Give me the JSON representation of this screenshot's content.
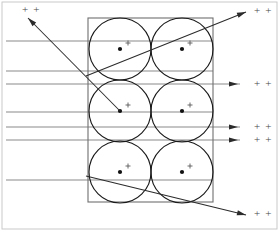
{
  "figure": {
    "width": 279,
    "height": 232,
    "background_color": "#ffffff"
  },
  "colors": {
    "frame": "#c9c9c9",
    "box": "#6f6f6f",
    "circle": "#1a1a1a",
    "ray": "#8a8a8a",
    "diagonal_ray": "#2b2b2b",
    "dot": "#111111",
    "plus": "#5a5a5a",
    "label_text": "#4a4a4a"
  },
  "frame": {
    "name": "outer-frame",
    "x": 2,
    "y": 2,
    "width": 275,
    "height": 227
  },
  "box": {
    "name": "scatterer-box",
    "x": 88,
    "y": 18,
    "width": 125,
    "height": 184
  },
  "circles": [
    {
      "id": "circle-r1c1",
      "cx": 120,
      "cy": 49,
      "r": 31,
      "dot_r": 2.1,
      "plus": {
        "x": 128,
        "y": 43,
        "size": 5
      }
    },
    {
      "id": "circle-r1c2",
      "cx": 182,
      "cy": 49,
      "r": 31,
      "dot_r": 2.1,
      "plus": {
        "x": 190,
        "y": 43,
        "size": 5
      }
    },
    {
      "id": "circle-r2c1",
      "cx": 120,
      "cy": 111,
      "r": 31,
      "dot_r": 2.1,
      "plus": {
        "x": 128,
        "y": 105,
        "size": 5
      }
    },
    {
      "id": "circle-r2c2",
      "cx": 182,
      "cy": 111,
      "r": 31,
      "dot_r": 2.1,
      "plus": {
        "x": 190,
        "y": 105,
        "size": 5
      }
    },
    {
      "id": "circle-r3c1",
      "cx": 120,
      "cy": 172,
      "r": 31,
      "dot_r": 2.1,
      "plus": {
        "x": 128,
        "y": 166,
        "size": 5
      }
    },
    {
      "id": "circle-r3c2",
      "cx": 182,
      "cy": 172,
      "r": 31,
      "dot_r": 2.1,
      "plus": {
        "x": 190,
        "y": 166,
        "size": 5
      }
    }
  ],
  "incoming_rays": [
    {
      "id": "ray-in-1",
      "x1": 6,
      "y1": 41,
      "x2": 213,
      "y2": 41
    },
    {
      "id": "ray-in-2",
      "x1": 6,
      "y1": 71,
      "x2": 213,
      "y2": 71
    },
    {
      "id": "ray-in-3",
      "x1": 6,
      "y1": 84,
      "x2": 240,
      "y2": 84
    },
    {
      "id": "ray-in-4",
      "x1": 6,
      "y1": 112,
      "x2": 213,
      "y2": 112
    },
    {
      "id": "ray-in-5",
      "x1": 6,
      "y1": 127,
      "x2": 240,
      "y2": 127
    },
    {
      "id": "ray-in-6",
      "x1": 6,
      "y1": 140,
      "x2": 240,
      "y2": 140
    },
    {
      "id": "ray-in-7",
      "x1": 6,
      "y1": 180,
      "x2": 213,
      "y2": 180
    }
  ],
  "diagonal_rays": [
    {
      "id": "ray-scattered-up",
      "description": "ray scattered up-left from middle-left circle center",
      "x1": 120,
      "y1": 111,
      "x2": 28,
      "y2": 18
    },
    {
      "id": "ray-scattered-through-top",
      "description": "ray rising through box to upper right exit",
      "x1": 86,
      "y1": 76,
      "x2": 246,
      "y2": 12
    },
    {
      "id": "ray-scattered-down",
      "description": "ray descending from lower-left toward lower right exit",
      "x1": 86,
      "y1": 176,
      "x2": 246,
      "y2": 215
    }
  ],
  "exit_arrows": [
    {
      "id": "arrow-exit-top",
      "x": 246,
      "y": 12,
      "angle": -21,
      "label_x": 254,
      "label_y": 11
    },
    {
      "id": "arrow-exit-mid-1",
      "x": 238,
      "y": 84,
      "angle": 0,
      "label_x": 254,
      "label_y": 84
    },
    {
      "id": "arrow-exit-mid-2",
      "x": 238,
      "y": 127,
      "angle": 0,
      "label_x": 254,
      "label_y": 127
    },
    {
      "id": "arrow-exit-mid-3",
      "x": 238,
      "y": 140,
      "angle": 0,
      "label_x": 254,
      "label_y": 140
    },
    {
      "id": "arrow-exit-bottom",
      "x": 246,
      "y": 215,
      "angle": 14,
      "label_x": 254,
      "label_y": 214
    },
    {
      "id": "arrow-scatter-up",
      "x": 28,
      "y": 18,
      "angle": 225,
      "label_x": 22,
      "label_y": 10
    }
  ],
  "labels": {
    "charge_symbol": "+ +",
    "items": [
      {
        "id": "label-top-left",
        "text": "+ +",
        "x": 22,
        "y": 10
      },
      {
        "id": "label-top-right",
        "text": "+ +",
        "x": 254,
        "y": 11
      },
      {
        "id": "label-right-1",
        "text": "+ +",
        "x": 254,
        "y": 84
      },
      {
        "id": "label-right-2",
        "text": "+ +",
        "x": 254,
        "y": 127
      },
      {
        "id": "label-right-3",
        "text": "+ +",
        "x": 254,
        "y": 140
      },
      {
        "id": "label-bottom-right",
        "text": "+ +",
        "x": 254,
        "y": 214
      }
    ]
  }
}
